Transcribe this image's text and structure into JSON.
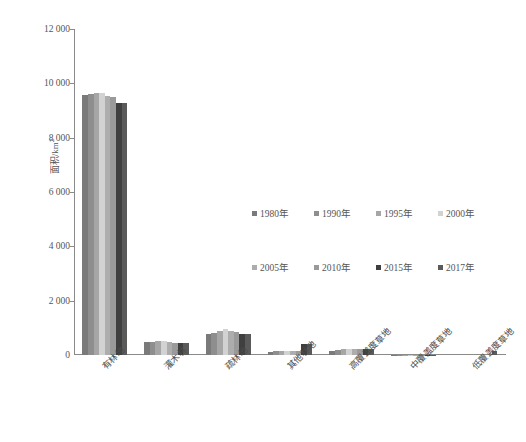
{
  "chart_data": {
    "type": "bar",
    "title": "",
    "subtitle": "",
    "xlabel": "",
    "ylabel": "面积/km²",
    "ylabel_base": "面积/km",
    "ylabel_sup": "2",
    "ylim": [
      0,
      12000
    ],
    "ytick_values": [
      0,
      2000,
      4000,
      6000,
      8000,
      10000,
      12000
    ],
    "ytick_labels": [
      "0",
      "2 000",
      "4 000",
      "6 000",
      "8 000",
      "10 000",
      "12 000"
    ],
    "grid": false,
    "legend_position": "center-right",
    "categories": [
      "有林地",
      "灌木林",
      "疏林地",
      "其他林地",
      "高覆盖度草地",
      "中覆盖度草地",
      "低覆盖度草地"
    ],
    "series": [
      {
        "name": "1980年",
        "color": "#7a7a7a",
        "values": [
          9560,
          470,
          760,
          110,
          150,
          10,
          0
        ]
      },
      {
        "name": "1990年",
        "color": "#8e8e8e",
        "values": [
          9600,
          480,
          820,
          130,
          200,
          12,
          0
        ]
      },
      {
        "name": "1995年",
        "color": "#a6a6a6",
        "values": [
          9640,
          510,
          900,
          150,
          215,
          12,
          0
        ]
      },
      {
        "name": "2000年",
        "color": "#d2d2d2",
        "values": [
          9660,
          520,
          950,
          160,
          225,
          14,
          0
        ]
      },
      {
        "name": "2005年",
        "color": "#adadad",
        "values": [
          9520,
          480,
          880,
          150,
          220,
          12,
          0
        ]
      },
      {
        "name": "2010年",
        "color": "#9a9a9a",
        "values": [
          9480,
          460,
          860,
          150,
          215,
          12,
          0
        ]
      },
      {
        "name": "2015年",
        "color": "#3f3f3f",
        "values": [
          9270,
          450,
          780,
          400,
          235,
          10,
          0
        ]
      },
      {
        "name": "2017年",
        "color": "#5a5a5a",
        "values": [
          9270,
          450,
          780,
          400,
          235,
          10,
          160
        ]
      }
    ]
  },
  "legend": {
    "rows": [
      [
        {
          "label": "1980年",
          "color": "#7a7a7a"
        },
        {
          "label": "1990年",
          "color": "#8e8e8e"
        },
        {
          "label": "1995年",
          "color": "#a6a6a6"
        },
        {
          "label": "2000年",
          "color": "#d2d2d2"
        }
      ],
      [
        {
          "label": "2005年",
          "color": "#adadad"
        },
        {
          "label": "2010年",
          "color": "#9a9a9a"
        },
        {
          "label": "2015年",
          "color": "#3f3f3f"
        },
        {
          "label": "2017年",
          "color": "#5a5a5a"
        }
      ]
    ]
  },
  "colors": {
    "axis": "#8a8a8a",
    "text": "#555555",
    "background": "#ffffff"
  }
}
